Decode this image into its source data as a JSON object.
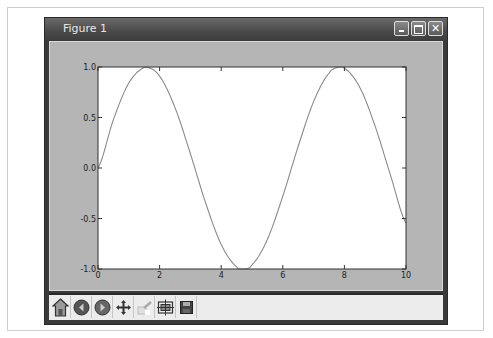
{
  "window": {
    "title": "Figure 1",
    "controls": [
      "minimize",
      "maximize",
      "close"
    ]
  },
  "toolbar": {
    "buttons": [
      {
        "icon": "home-icon",
        "label": "Home"
      },
      {
        "icon": "back-icon",
        "label": "Back"
      },
      {
        "icon": "forward-icon",
        "label": "Forward"
      },
      {
        "icon": "pan-icon",
        "label": "Pan"
      },
      {
        "icon": "zoom-icon",
        "label": "Zoom"
      },
      {
        "icon": "subplots-icon",
        "label": "Configure subplots"
      },
      {
        "icon": "save-icon",
        "label": "Save"
      }
    ]
  },
  "chart_data": {
    "type": "line",
    "title": "",
    "xlabel": "",
    "ylabel": "",
    "xlim": [
      0,
      10
    ],
    "ylim": [
      -1.0,
      1.0
    ],
    "xticks": [
      "0",
      "2",
      "4",
      "6",
      "8",
      "10"
    ],
    "yticks": [
      "1.0",
      "0.5",
      "0.0",
      "-0.5",
      "-1.0"
    ],
    "grid": false,
    "legend": null,
    "series": [
      {
        "name": "sin(x)",
        "color": "#8a8a8a",
        "x": [
          0,
          0.5,
          1,
          1.5,
          1.5708,
          2,
          2.5,
          3,
          3.5,
          4,
          4.5,
          4.7124,
          5,
          5.5,
          6,
          6.5,
          7,
          7.5,
          7.854,
          8,
          8.5,
          9,
          9.5,
          10
        ],
        "y": [
          0,
          0.479,
          0.841,
          0.997,
          1.0,
          0.909,
          0.598,
          0.141,
          -0.351,
          -0.757,
          -0.978,
          -1.0,
          -0.959,
          -0.706,
          -0.279,
          0.215,
          0.657,
          0.938,
          1.0,
          0.989,
          0.798,
          0.412,
          -0.075,
          -0.544
        ]
      }
    ]
  }
}
